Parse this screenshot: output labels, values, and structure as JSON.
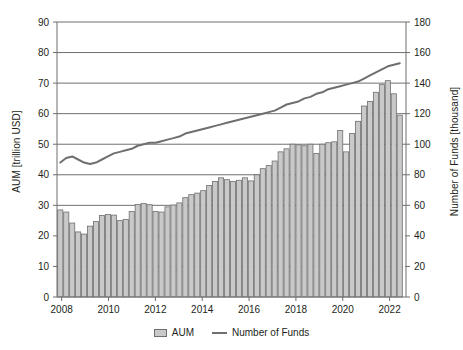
{
  "chart_data": {
    "type": "bar",
    "title": "",
    "subtitle": "",
    "xlabel": "",
    "ylabel": "AUM [trillion USD]",
    "y2label": "Number of Funds [thousand]",
    "grid": true,
    "legend_position": "bottom",
    "xlim": [
      2007.8,
      2022.7
    ],
    "ylim": [
      0,
      90
    ],
    "y2lim": [
      0,
      180
    ],
    "x_ticks": [
      2008,
      2010,
      2012,
      2014,
      2016,
      2018,
      2020,
      2022
    ],
    "x_tick_labels": [
      "2008",
      "2010",
      "2012",
      "2014",
      "2016",
      "2018",
      "2020",
      "2022"
    ],
    "y_ticks": [
      0,
      10,
      20,
      30,
      40,
      50,
      60,
      70,
      80,
      90
    ],
    "y_tick_labels": [
      "0",
      "10",
      "20",
      "30",
      "40",
      "50",
      "60",
      "70",
      "80",
      "90"
    ],
    "y2_ticks": [
      0,
      20,
      40,
      60,
      80,
      100,
      120,
      140,
      160,
      180
    ],
    "y2_tick_labels": [
      "0",
      "20",
      "40",
      "60",
      "80",
      "100",
      "120",
      "140",
      "160",
      "180"
    ],
    "x": [
      2008.0,
      2008.25,
      2008.5,
      2008.75,
      2009.0,
      2009.25,
      2009.5,
      2009.75,
      2010.0,
      2010.25,
      2010.5,
      2010.75,
      2011.0,
      2011.25,
      2011.5,
      2011.75,
      2012.0,
      2012.25,
      2012.5,
      2012.75,
      2013.0,
      2013.25,
      2013.5,
      2013.75,
      2014.0,
      2014.25,
      2014.5,
      2014.75,
      2015.0,
      2015.25,
      2015.5,
      2015.75,
      2016.0,
      2016.25,
      2016.5,
      2016.75,
      2017.0,
      2017.25,
      2017.5,
      2017.75,
      2018.0,
      2018.25,
      2018.5,
      2018.75,
      2019.0,
      2019.25,
      2019.5,
      2019.75,
      2020.0,
      2020.25,
      2020.5,
      2020.75,
      2021.0,
      2021.25,
      2021.5,
      2021.75,
      2022.0,
      2022.25
    ],
    "series": [
      {
        "name": "AUM",
        "type": "bar",
        "axis": "left",
        "unit": "trillion USD",
        "color": "#c9c9c9",
        "edge_color": "#6f6f6f",
        "values": [
          28.5,
          27.8,
          24.2,
          21.3,
          20.6,
          23.2,
          24.7,
          26.7,
          27.0,
          26.8,
          25.0,
          25.4,
          28.0,
          30.3,
          30.6,
          30.2,
          28.0,
          27.8,
          29.5,
          30.1,
          30.8,
          32.5,
          33.5,
          34.0,
          34.8,
          36.5,
          37.8,
          39.0,
          38.4,
          37.8,
          38.2,
          39.0,
          38.0,
          40.0,
          42.0,
          43.0,
          44.5,
          47.5,
          48.5,
          50.0,
          49.8,
          49.5,
          50.0,
          47.0,
          50.0,
          50.5,
          50.8,
          54.5,
          47.5,
          53.5,
          57.5,
          62.5,
          64.0,
          67.0,
          69.5,
          70.8,
          66.5,
          59.5
        ]
      },
      {
        "name": "Number of Funds",
        "type": "line",
        "axis": "right",
        "unit": "thousand",
        "color": "#6f6f6f",
        "values": [
          88,
          91,
          92,
          90,
          88,
          87,
          88,
          90,
          92,
          94,
          95,
          96,
          97,
          99,
          100,
          101,
          101,
          102,
          103,
          104,
          105,
          107,
          108,
          109,
          110,
          111,
          112,
          113,
          114,
          115,
          116,
          117,
          118,
          119,
          120,
          121,
          122,
          124,
          126,
          127,
          128,
          130,
          131,
          133,
          134,
          136,
          137,
          138,
          139,
          140,
          141,
          143,
          145,
          147,
          149,
          151,
          152,
          153
        ]
      }
    ]
  },
  "legend": {
    "entries": [
      {
        "label": "AUM",
        "marker": "bar-swatch"
      },
      {
        "label": "Number of Funds",
        "marker": "line-swatch"
      }
    ]
  }
}
